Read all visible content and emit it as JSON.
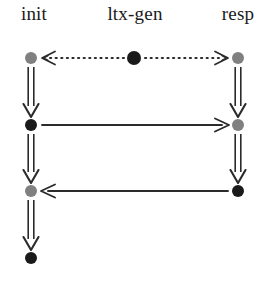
{
  "diagram": {
    "type": "message-sequence-chart",
    "width": 275,
    "height": 287,
    "background_color": "#ffffff",
    "lifelines": [
      {
        "id": "init",
        "label": "init",
        "x": 31,
        "label_x": 34
      },
      {
        "id": "ltx-gen",
        "label": "ltx-gen",
        "x": 134,
        "label_x": 135
      },
      {
        "id": "resp",
        "label": "resp",
        "x": 238,
        "label_x": 238
      }
    ],
    "label_y": 14,
    "rows_y": [
      58,
      125,
      191,
      258
    ],
    "node_colors": {
      "gray": "#808080",
      "black": "#1a1a1a"
    },
    "nodes": [
      {
        "lifeline": "init",
        "row": 0,
        "x": 31,
        "y": 58,
        "color": "#808080",
        "r": 6
      },
      {
        "lifeline": "init",
        "row": 1,
        "x": 31,
        "y": 125,
        "color": "#1a1a1a",
        "r": 6
      },
      {
        "lifeline": "init",
        "row": 2,
        "x": 31,
        "y": 191,
        "color": "#808080",
        "r": 6
      },
      {
        "lifeline": "init",
        "row": 3,
        "x": 31,
        "y": 258,
        "color": "#1a1a1a",
        "r": 6
      },
      {
        "lifeline": "ltx-gen",
        "row": 0,
        "x": 134,
        "y": 58,
        "color": "#1a1a1a",
        "r": 7
      },
      {
        "lifeline": "resp",
        "row": 0,
        "x": 238,
        "y": 58,
        "color": "#808080",
        "r": 6
      },
      {
        "lifeline": "resp",
        "row": 1,
        "x": 238,
        "y": 125,
        "color": "#808080",
        "r": 6
      },
      {
        "lifeline": "resp",
        "row": 2,
        "x": 238,
        "y": 191,
        "color": "#1a1a1a",
        "r": 6
      }
    ],
    "vertical_arrows": [
      {
        "lifeline": "init",
        "x": 31,
        "from_y": 67,
        "to_y": 117,
        "style": "double"
      },
      {
        "lifeline": "init",
        "x": 31,
        "from_y": 134,
        "to_y": 183,
        "style": "double"
      },
      {
        "lifeline": "init",
        "x": 31,
        "from_y": 200,
        "to_y": 250,
        "style": "double"
      },
      {
        "lifeline": "resp",
        "x": 238,
        "from_y": 67,
        "to_y": 117,
        "style": "double"
      },
      {
        "lifeline": "resp",
        "x": 238,
        "from_y": 134,
        "to_y": 183,
        "style": "double"
      }
    ],
    "messages": [
      {
        "id": "msg-ltxgen-to-init",
        "from": "ltx-gen",
        "to": "init",
        "row": 0,
        "y": 58,
        "x1": 124,
        "x2": 42,
        "style": "dotted",
        "direction": "left",
        "label": ""
      },
      {
        "id": "msg-ltxgen-to-resp",
        "from": "ltx-gen",
        "to": "resp",
        "row": 0,
        "y": 58,
        "x1": 145,
        "x2": 228,
        "style": "dotted",
        "direction": "right",
        "label": ""
      },
      {
        "id": "msg-init-to-resp",
        "from": "init",
        "to": "resp",
        "row": 1,
        "y": 125,
        "x1": 42,
        "x2": 229,
        "style": "solid",
        "direction": "right",
        "label": ""
      },
      {
        "id": "msg-resp-to-init",
        "from": "resp",
        "to": "init",
        "row": 2,
        "y": 191,
        "x1": 228,
        "x2": 41,
        "style": "solid",
        "direction": "left",
        "label": ""
      }
    ],
    "line_color": "#2b2b2b"
  }
}
